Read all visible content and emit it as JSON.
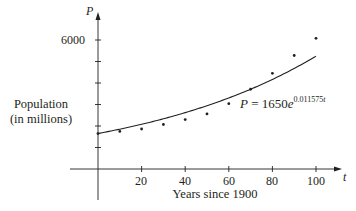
{
  "chart_data": {
    "type": "scatter",
    "title": "",
    "xlabel": "Years since 1900",
    "ylabel": "Population (in millions)",
    "x_axis_variable": "t",
    "y_axis_variable": "P",
    "x_ticks": [
      20,
      40,
      60,
      80,
      100
    ],
    "y_ticks_labeled": [
      6000
    ],
    "y_ticks": [
      1000,
      2000,
      3000,
      4000,
      5000,
      6000
    ],
    "xlim": [
      -13,
      110
    ],
    "ylim": [
      -1400,
      7400
    ],
    "grid": false,
    "series": [
      {
        "name": "Population data",
        "type": "scatter",
        "x": [
          0,
          10,
          20,
          30,
          40,
          50,
          60,
          70,
          80,
          90,
          100
        ],
        "y": [
          1650,
          1750,
          1860,
          2070,
          2300,
          2560,
          3040,
          3710,
          4450,
          5280,
          6080
        ]
      },
      {
        "name": "Exponential model",
        "type": "line",
        "formula": "P = 1650e^(0.011575t)",
        "a": 1650,
        "k": 0.011575,
        "x_range": [
          0,
          100
        ]
      }
    ],
    "annotations": [
      {
        "text": "P = 1650e^0.011575t",
        "position": "right of curve near t=65"
      }
    ]
  },
  "labels": {
    "ylabel_line1": "Population",
    "ylabel_line2": "(in millions)",
    "xlabel": "Years since 1900",
    "y_var": "P",
    "x_var": "t",
    "y_tick_6000": "6000",
    "x_tick_20": "20",
    "x_tick_40": "40",
    "x_tick_60": "60",
    "x_tick_80": "80",
    "x_tick_100": "100",
    "eq_P": "P",
    "eq_eq": " = 1650",
    "eq_e": "e",
    "eq_exp": "0.011575",
    "eq_t": "t"
  }
}
